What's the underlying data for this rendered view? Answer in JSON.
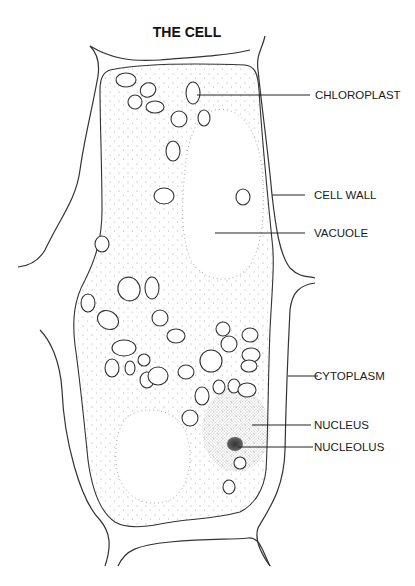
{
  "title": "THE CELL",
  "labels": [
    {
      "key": "chloroplast",
      "text": "CHLOROPLAST"
    },
    {
      "key": "cell-wall",
      "text": "CELL WALL"
    },
    {
      "key": "vacuole",
      "text": "VACUOLE"
    },
    {
      "key": "cytoplasm",
      "text": "CYTOPLASM"
    },
    {
      "key": "nucleus",
      "text": "NUCLEUS"
    },
    {
      "key": "nucleolus",
      "text": "NUCLEOLUS"
    }
  ],
  "colors": {
    "line": "#333333",
    "stipple": "#9a9a9a",
    "nucleus_dots": "#555555",
    "nucleolus": "#444444"
  }
}
